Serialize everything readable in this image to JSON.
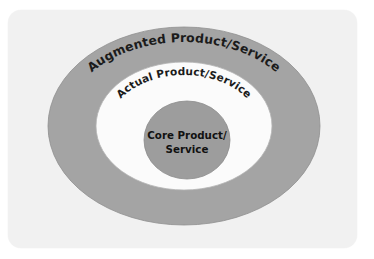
{
  "diagram": {
    "type": "concentric-circles",
    "background_color": "#ffffff",
    "card_color": "#f1f1f1",
    "layers": [
      {
        "id": "outer",
        "label": "Augmented Product/Service",
        "fill_color": "#a4a4a4",
        "text_color": "#1b1b1b",
        "level": 3
      },
      {
        "id": "middle",
        "label": "Actual Product/Service",
        "fill_color": "#fbfbfb",
        "text_color": "#1b1b1b",
        "level": 2
      },
      {
        "id": "core",
        "label_line1": "Core Product/",
        "label_line2": "Service",
        "fill_color": "#9d9d9d",
        "text_color": "#111111",
        "level": 1
      }
    ]
  }
}
